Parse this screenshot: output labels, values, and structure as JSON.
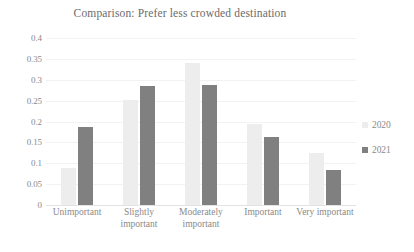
{
  "chart_data": {
    "type": "bar",
    "title": "Comparison: Prefer less crowded destination",
    "xlabel": "",
    "ylabel": "",
    "ylim": [
      0,
      0.4
    ],
    "ytick_labels": [
      "0.4",
      "0.35",
      "0.3",
      "0.25",
      "0.2",
      "0.15",
      "0.1",
      "0.05",
      "0"
    ],
    "ytick_values": [
      0.4,
      0.35,
      0.3,
      0.25,
      0.2,
      0.15,
      0.1,
      0.05,
      0
    ],
    "grid": true,
    "legend_position": "right",
    "categories": [
      "Unimportant",
      "Slightly\nimportant",
      "Moderately\nimportant",
      "Important",
      "Very important"
    ],
    "series": [
      {
        "name": "2020",
        "color": "#ededed",
        "values": [
          0.089,
          0.252,
          0.34,
          0.193,
          0.124
        ]
      },
      {
        "name": "2021",
        "color": "#808080",
        "values": [
          0.188,
          0.284,
          0.288,
          0.162,
          0.083
        ]
      }
    ]
  },
  "colors": {
    "series_2020": "#ededed",
    "series_2021": "#808080",
    "gridline": "#f2f2f2",
    "axis": "#e3e3e3",
    "text": "#8a8a8a",
    "title_text": "#6b6b6b",
    "background": "#ffffff"
  }
}
